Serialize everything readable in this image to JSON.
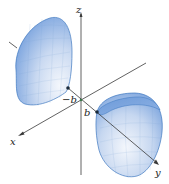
{
  "figure": {
    "axes": {
      "x": {
        "label": "x"
      },
      "y": {
        "label": "y"
      },
      "z": {
        "label": "z"
      }
    },
    "points": [
      {
        "label": "-b",
        "display": "−b"
      },
      {
        "label": "b",
        "display": "b"
      }
    ],
    "colors": {
      "surface_light": "#f2f6fc",
      "surface_mid": "#a9c4ea",
      "surface_dark": "#5b8fd6",
      "edge": "#3f78c0",
      "axis": "#3a3a3a",
      "point": "#1a2a3a"
    }
  }
}
